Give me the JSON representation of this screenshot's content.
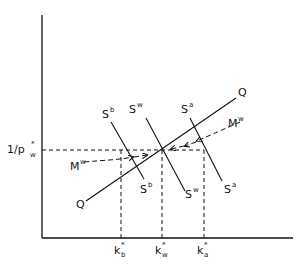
{
  "diagram": {
    "y_axis_label": {
      "prefix": "1/p",
      "sub": "w",
      "sup": "*"
    },
    "x_ticks": [
      {
        "base": "k",
        "sup": "*",
        "sub": "b"
      },
      {
        "base": "k",
        "sup": "*",
        "sub": "w"
      },
      {
        "base": "k",
        "sup": "*",
        "sub": "a"
      }
    ],
    "curves": {
      "Q": {
        "label": "Q"
      },
      "Sb": {
        "base": "S",
        "sup": "b"
      },
      "Sw": {
        "base": "S",
        "sup": "w"
      },
      "Sa": {
        "base": "S",
        "sup": "a"
      }
    },
    "arrows": {
      "Mw_left": {
        "base": "M",
        "sup": "w"
      },
      "Mw_right": {
        "base": "M",
        "sup": "w"
      }
    }
  }
}
